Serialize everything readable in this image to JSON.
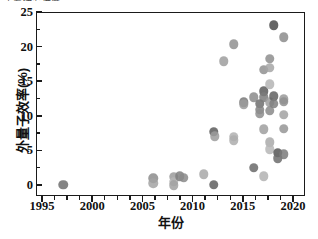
{
  "figure": {
    "top_fragment_text": "主要研究进展",
    "background": "#ffffff",
    "frame_color": "#1a1a1a"
  },
  "chart_data": {
    "type": "scatter",
    "title": "",
    "xlabel": "年份",
    "ylabel": "外量子效率(%)",
    "xlim": [
      1994.4,
      2021.2
    ],
    "ylim": [
      -1.6,
      25.0
    ],
    "xticks": [
      1995,
      2000,
      2005,
      2010,
      2015,
      2020
    ],
    "xticklabels": [
      "1995",
      "2000",
      "2005",
      "2010",
      "2015",
      "2020"
    ],
    "yticks": [
      0,
      5,
      10,
      15,
      20,
      25
    ],
    "yticklabels": [
      "0",
      "5",
      "10",
      "15",
      "20",
      "25"
    ],
    "xminor_step": 1.25,
    "yminor_step": 2.5,
    "grid": false,
    "legend": null,
    "marker": "circle",
    "marker_size_px": 9.5,
    "marker_opacity": 0.85,
    "points": [
      {
        "x": 1997.0,
        "y": 0.2,
        "color": "#6f6f6f"
      },
      {
        "x": 2006.0,
        "y": 1.1,
        "color": "#8c8c8c"
      },
      {
        "x": 2006.0,
        "y": 0.4,
        "color": "#a3a3a3"
      },
      {
        "x": 2008.0,
        "y": 1.3,
        "color": "#9a9a9a"
      },
      {
        "x": 2008.0,
        "y": 0.6,
        "color": "#b5b5b5"
      },
      {
        "x": 2008.0,
        "y": 0.1,
        "color": "#a0a0a0"
      },
      {
        "x": 2008.6,
        "y": 1.4,
        "color": "#7e7e7e"
      },
      {
        "x": 2009.0,
        "y": 1.2,
        "color": "#8a8a8a"
      },
      {
        "x": 2011.0,
        "y": 1.7,
        "color": "#a8a8a8"
      },
      {
        "x": 2012.0,
        "y": 0.2,
        "color": "#5f5f5f"
      },
      {
        "x": 2012.0,
        "y": 7.8,
        "color": "#5c5c5c"
      },
      {
        "x": 2012.1,
        "y": 7.2,
        "color": "#9c9c9c"
      },
      {
        "x": 2013.0,
        "y": 18.0,
        "color": "#9e9e9e"
      },
      {
        "x": 2014.0,
        "y": 20.5,
        "color": "#8f8f8f"
      },
      {
        "x": 2014.0,
        "y": 7.1,
        "color": "#b0b0b0"
      },
      {
        "x": 2014.0,
        "y": 6.6,
        "color": "#adadad"
      },
      {
        "x": 2015.0,
        "y": 12.1,
        "color": "#777777"
      },
      {
        "x": 2015.0,
        "y": 11.8,
        "color": "#9b9b9b"
      },
      {
        "x": 2016.0,
        "y": 12.8,
        "color": "#8b8b8b"
      },
      {
        "x": 2016.0,
        "y": 2.6,
        "color": "#6a6a6a"
      },
      {
        "x": 2016.6,
        "y": 11.9,
        "color": "#6e6e6e"
      },
      {
        "x": 2016.6,
        "y": 11.0,
        "color": "#838383"
      },
      {
        "x": 2016.6,
        "y": 10.4,
        "color": "#8d8d8d"
      },
      {
        "x": 2017.0,
        "y": 16.8,
        "color": "#909090"
      },
      {
        "x": 2017.0,
        "y": 13.7,
        "color": "#5a5a5a"
      },
      {
        "x": 2017.0,
        "y": 12.8,
        "color": "#7b7b7b"
      },
      {
        "x": 2017.0,
        "y": 8.2,
        "color": "#9f9f9f"
      },
      {
        "x": 2017.0,
        "y": 1.4,
        "color": "#b2b2b2"
      },
      {
        "x": 2017.6,
        "y": 18.4,
        "color": "#8e8e8e"
      },
      {
        "x": 2017.6,
        "y": 17.1,
        "color": "#a6a6a6"
      },
      {
        "x": 2017.6,
        "y": 14.7,
        "color": "#b4b4b4"
      },
      {
        "x": 2017.6,
        "y": 12.1,
        "color": "#9d9d9d"
      },
      {
        "x": 2017.6,
        "y": 10.9,
        "color": "#8a8a8a"
      },
      {
        "x": 2017.6,
        "y": 6.3,
        "color": "#a9a9a9"
      },
      {
        "x": 2017.6,
        "y": 5.3,
        "color": "#b6b6b6"
      },
      {
        "x": 2018.0,
        "y": 23.2,
        "color": "#4a4a4a"
      },
      {
        "x": 2018.0,
        "y": 13.0,
        "color": "#606060"
      },
      {
        "x": 2018.0,
        "y": 11.9,
        "color": "#7f7f7f"
      },
      {
        "x": 2018.4,
        "y": 4.8,
        "color": "#555555"
      },
      {
        "x": 2018.4,
        "y": 4.0,
        "color": "#6c6c6c"
      },
      {
        "x": 2019.0,
        "y": 21.5,
        "color": "#8c8c8c"
      },
      {
        "x": 2019.0,
        "y": 12.5,
        "color": "#999999"
      },
      {
        "x": 2019.0,
        "y": 12.2,
        "color": "#8f8f8f"
      },
      {
        "x": 2019.0,
        "y": 10.3,
        "color": "#a2a2a2"
      },
      {
        "x": 2019.0,
        "y": 8.3,
        "color": "#959595"
      },
      {
        "x": 2019.0,
        "y": 4.6,
        "color": "#7a7a7a"
      }
    ]
  }
}
